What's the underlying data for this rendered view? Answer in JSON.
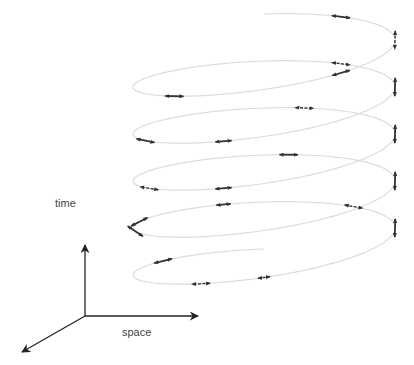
{
  "diagram": {
    "title": "",
    "colors": {
      "helix": "#dcdcdc",
      "arrow": "#333333",
      "axis": "#222222",
      "label": "#444444",
      "background": "#ffffff"
    },
    "axes": {
      "origin": [
        85,
        316
      ],
      "time": {
        "label": "time",
        "tip": [
          85,
          245
        ],
        "label_pos": [
          55,
          197
        ]
      },
      "space": {
        "label": "space",
        "tip": [
          198,
          316
        ],
        "label_pos": [
          122,
          326
        ]
      },
      "depth": {
        "label": "",
        "tip": [
          22,
          352
        ]
      }
    },
    "helix": {
      "turns": 5,
      "center_x": 264,
      "radius_x": 131,
      "radius_y": 26,
      "top_y": 40,
      "pitch": 47,
      "tilt": 0.18,
      "samples_per_turn": 120
    },
    "arrows": [
      {
        "t": 0.25,
        "len": 18,
        "dashed": true
      },
      {
        "t": 0.4,
        "len": 18,
        "dashed": false
      },
      {
        "t": 0.1,
        "len": 18,
        "dashed": false
      },
      {
        "t": 0.62,
        "len": 18,
        "dashed": false
      },
      {
        "t": 1.25,
        "len": 18,
        "dashed": false
      },
      {
        "t": 1.1,
        "len": 18,
        "dashed": true
      },
      {
        "t": 1.55,
        "len": 16,
        "dashed": false
      },
      {
        "t": 1.68,
        "len": 18,
        "dashed": false
      },
      {
        "t": 2.25,
        "len": 18,
        "dashed": false
      },
      {
        "t": 2.05,
        "len": 18,
        "dashed": true
      },
      {
        "t": 2.55,
        "len": 16,
        "dashed": false
      },
      {
        "t": 2.67,
        "len": 18,
        "dashed": true
      },
      {
        "t": 3.25,
        "len": 18,
        "dashed": false
      },
      {
        "t": 3.03,
        "len": 18,
        "dashed": false
      },
      {
        "t": 3.72,
        "len": 18,
        "dashed": false
      },
      {
        "t": 3.95,
        "len": 14,
        "dashed": false
      },
      {
        "t": 4.25,
        "len": 18,
        "dashed": false
      },
      {
        "t": 3.8,
        "len": 18,
        "dashed": false
      },
      {
        "t": 4.58,
        "len": 18,
        "dashed": true
      },
      {
        "t": 4.5,
        "len": 12,
        "dashed": true
      },
      {
        "t": 4.86,
        "len": 18,
        "dashed": false
      },
      {
        "t": 4.12,
        "len": 18,
        "dashed": true
      }
    ]
  }
}
